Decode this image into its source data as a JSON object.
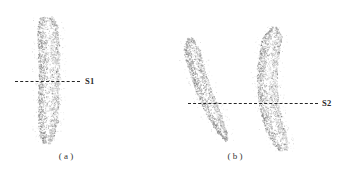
{
  "figure": {
    "background_color": "#ffffff",
    "width": 347,
    "height": 176,
    "cloud_color": "#9d9d9d",
    "line_color": "#262626",
    "text_color": "#2b2b2b"
  },
  "panels": [
    {
      "id": "a",
      "caption": "( a )",
      "section_label": "S1",
      "cloud_count": 1
    },
    {
      "id": "b",
      "caption": "( b )",
      "section_label": "S2",
      "cloud_count": 2
    }
  ],
  "chart_data": {
    "type": "scatter",
    "title": "",
    "xlabel": "",
    "ylabel": "",
    "panels": [
      {
        "label": "( a )",
        "section_line_label": "S1",
        "section_line_y": 81,
        "section_line_x_start": 15,
        "section_line_x_end": 80,
        "clouds": [
          {
            "name": "strip-a",
            "bbox": [
              35,
              17,
              26,
              126
            ],
            "orientation": "vertical",
            "curvature": "slight",
            "point_count": 2200
          }
        ]
      },
      {
        "label": "( b )",
        "section_line_label": "S2",
        "section_line_y": 103,
        "section_line_x_start": 188,
        "section_line_x_end": 318,
        "clouds": [
          {
            "name": "crescent-b-left",
            "bbox": [
              189,
              38,
              47,
              102
            ],
            "orientation": "diagonal",
            "curvature": "concave-right",
            "point_count": 1700
          },
          {
            "name": "crescent-b-right",
            "bbox": [
              252,
              27,
              45,
              123
            ],
            "orientation": "vertical",
            "curvature": "concave-left",
            "point_count": 2100
          }
        ]
      }
    ]
  },
  "captions": {
    "a": "( a )",
    "b": "( b )"
  },
  "labels": {
    "s1": "S1",
    "s2": "S2"
  }
}
